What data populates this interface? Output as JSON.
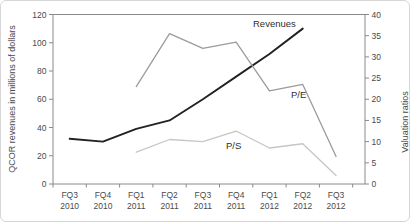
{
  "chart_data": {
    "type": "line",
    "title": "",
    "categories": [
      {
        "quarter": "FQ3",
        "year": "2010"
      },
      {
        "quarter": "FQ4",
        "year": "2010"
      },
      {
        "quarter": "FQ1",
        "year": "2011"
      },
      {
        "quarter": "FQ2",
        "year": "2011"
      },
      {
        "quarter": "FQ3",
        "year": "2011"
      },
      {
        "quarter": "FQ4",
        "year": "2011"
      },
      {
        "quarter": "FQ1",
        "year": "2012"
      },
      {
        "quarter": "FQ2",
        "year": "2012"
      },
      {
        "quarter": "FQ3",
        "year": "2012"
      }
    ],
    "left_axis": {
      "label": "QCOR revenues in millions of dollars",
      "min": 0,
      "max": 120,
      "step": 20,
      "ticks": [
        0,
        20,
        40,
        60,
        80,
        100,
        120
      ]
    },
    "right_axis": {
      "label": "Valuation ratios",
      "min": 0,
      "max": 40,
      "step": 5,
      "ticks": [
        0,
        5,
        10,
        15,
        20,
        25,
        30,
        35,
        40
      ]
    },
    "series": [
      {
        "name": "Revenues",
        "axis": "left",
        "color": "#222222",
        "stroke_width": 1.9,
        "values": [
          32,
          30,
          39,
          45,
          60,
          76,
          92,
          110,
          null
        ]
      },
      {
        "name": "P/E",
        "axis": "right",
        "color": "#9b9b9b",
        "stroke_width": 1.3,
        "values": [
          null,
          null,
          23,
          35.5,
          32,
          33.5,
          22,
          23.5,
          6.5
        ]
      },
      {
        "name": "P/S",
        "axis": "right",
        "color": "#c6c6c6",
        "stroke_width": 1.3,
        "values": [
          null,
          null,
          7.5,
          10.5,
          10,
          12.5,
          8.5,
          9.5,
          2
        ]
      }
    ],
    "grid": false,
    "legend": "inline-labels",
    "frame_color": "#8a8a8a",
    "text_color": "#4a4a4a"
  }
}
